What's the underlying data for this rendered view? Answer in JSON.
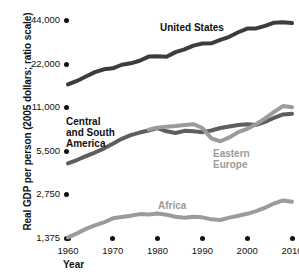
{
  "chart_data": {
    "type": "line",
    "title": "",
    "xlabel": "Year",
    "ylabel": "Real GDP per person (2005 dollars; ratio scale)",
    "scale": "log",
    "grid": false,
    "legend_position": "inline-labels",
    "xlim": [
      1960,
      2010
    ],
    "ylim": [
      1375,
      44000
    ],
    "xticks": [
      "1960",
      "1970",
      "1980",
      "1990",
      "2000",
      "2010"
    ],
    "xtick_values": [
      1960,
      1970,
      1980,
      1990,
      2000,
      2010
    ],
    "yticks": [
      "1,375",
      "2,750",
      "5,500",
      "11,000",
      "22,000",
      "44,000"
    ],
    "ytick_values": [
      1375,
      2750,
      5500,
      11000,
      22000,
      44000
    ],
    "series": [
      {
        "name": "United States",
        "color": "#3c3c3c",
        "label_x": 160,
        "label_y": 22,
        "x": [
          1960,
          1962,
          1964,
          1966,
          1968,
          1970,
          1972,
          1974,
          1976,
          1978,
          1980,
          1982,
          1984,
          1986,
          1988,
          1990,
          1992,
          1994,
          1996,
          1998,
          2000,
          2002,
          2004,
          2006,
          2008,
          2010
        ],
        "values": [
          15800,
          16700,
          17900,
          19200,
          20100,
          20400,
          21600,
          22100,
          23000,
          24600,
          24700,
          24500,
          26400,
          27600,
          29300,
          30300,
          30400,
          32100,
          33700,
          36200,
          38400,
          38500,
          40100,
          42200,
          42400,
          41900
        ]
      },
      {
        "name": "Central\nand South\nAmerica",
        "color": "#5e5e5e",
        "label_x": 66,
        "label_y": 116,
        "x": [
          1960,
          1962,
          1964,
          1966,
          1968,
          1970,
          1972,
          1974,
          1976,
          1978,
          1980,
          1982,
          1984,
          1986,
          1988,
          1990,
          1992,
          1994,
          1996,
          1998,
          2000,
          2002,
          2004,
          2006,
          2008,
          2010
        ],
        "values": [
          4500,
          4750,
          5050,
          5350,
          5700,
          6150,
          6650,
          7050,
          7350,
          7600,
          7900,
          7500,
          7300,
          7550,
          7500,
          7400,
          7600,
          7900,
          8100,
          8300,
          8400,
          8300,
          8700,
          9300,
          9800,
          9900
        ]
      },
      {
        "name": "Eastern\nEurope",
        "color": "#9b9b9b",
        "label_x": 213,
        "label_y": 148,
        "x": [
          1978,
          1980,
          1982,
          1984,
          1986,
          1988,
          1990,
          1992,
          1994,
          1996,
          1998,
          2000,
          2002,
          2004,
          2006,
          2008,
          2010
        ],
        "values": [
          7700,
          7950,
          8050,
          8150,
          8300,
          8400,
          7900,
          6700,
          6400,
          6800,
          7400,
          7800,
          8400,
          9200,
          10200,
          11200,
          11000
        ]
      },
      {
        "name": "Africa",
        "color": "#9b9b9b",
        "label_x": 158,
        "label_y": 200,
        "x": [
          1960,
          1962,
          1964,
          1966,
          1968,
          1970,
          1972,
          1974,
          1976,
          1978,
          1980,
          1982,
          1984,
          1986,
          1988,
          1990,
          1992,
          1994,
          1996,
          1998,
          2000,
          2002,
          2004,
          2006,
          2008,
          2010
        ],
        "values": [
          1390,
          1480,
          1590,
          1680,
          1760,
          1880,
          1920,
          1960,
          2010,
          2000,
          2030,
          1990,
          1930,
          1900,
          1930,
          1910,
          1850,
          1830,
          1900,
          1960,
          2020,
          2110,
          2230,
          2380,
          2500,
          2450
        ]
      }
    ]
  },
  "axis": {
    "y_title": "Real GDP per person (2005 dollars; ratio scale)",
    "x_title": "Year"
  }
}
